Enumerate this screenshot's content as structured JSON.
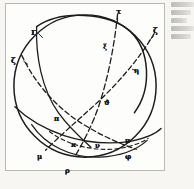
{
  "figure": {
    "frame_color": "#b9b9b4",
    "ink_color": "#1c1c1c",
    "paper_color": "#fdfdfb",
    "background_color": "#f7f6f3",
    "sphere": {
      "center_x": 84,
      "center_y": 86,
      "radius": 74
    },
    "labels": [
      {
        "id": "label-tau-top",
        "text": "τ",
        "x": 114,
        "y": 6,
        "size": "normal"
      },
      {
        "id": "label-gamma",
        "text": "Γ",
        "x": 30,
        "y": 28,
        "size": "normal"
      },
      {
        "id": "label-zeta-right",
        "text": "ζ",
        "x": 152,
        "y": 26,
        "size": "normal"
      },
      {
        "id": "label-zeta-left",
        "text": "ζ",
        "x": 10,
        "y": 56,
        "size": "normal"
      },
      {
        "id": "label-xi",
        "text": "ξ",
        "x": 102,
        "y": 42,
        "size": "small"
      },
      {
        "id": "label-eta-right",
        "text": "η",
        "x": 133,
        "y": 66,
        "size": "small"
      },
      {
        "id": "label-theta-center",
        "text": "ϑ",
        "x": 103,
        "y": 98,
        "size": "small"
      },
      {
        "id": "label-pi-left",
        "text": "π",
        "x": 53,
        "y": 114,
        "size": "small"
      },
      {
        "id": "label-kappa",
        "text": "κ",
        "x": 70,
        "y": 140,
        "size": "small"
      },
      {
        "id": "label-nu",
        "text": "ν",
        "x": 94,
        "y": 141,
        "size": "small"
      },
      {
        "id": "label-pi-right",
        "text": "π",
        "x": 124,
        "y": 136,
        "size": "small"
      },
      {
        "id": "label-phi",
        "text": "φ",
        "x": 124,
        "y": 152,
        "size": "small"
      },
      {
        "id": "label-mu",
        "text": "μ",
        "x": 36,
        "y": 152,
        "size": "small"
      },
      {
        "id": "label-rho",
        "text": "ρ",
        "x": 64,
        "y": 166,
        "size": "small"
      }
    ],
    "arcs": [
      {
        "id": "outer-sphere-circle",
        "style": "solid"
      },
      {
        "id": "oblique-great-circle-1",
        "style": "solid"
      },
      {
        "id": "oblique-great-circle-2",
        "style": "solid"
      },
      {
        "id": "horizon-arc",
        "style": "solid"
      },
      {
        "id": "meridian-dashed-arc",
        "style": "dashed"
      },
      {
        "id": "ecliptic-dashed-arc",
        "style": "dashed"
      },
      {
        "id": "colure-dashed-arc",
        "style": "dashed"
      },
      {
        "id": "lower-solid-arc",
        "style": "solid"
      },
      {
        "id": "lower-dashed-arc",
        "style": "dashed"
      }
    ],
    "margin_note_lines": 5
  }
}
